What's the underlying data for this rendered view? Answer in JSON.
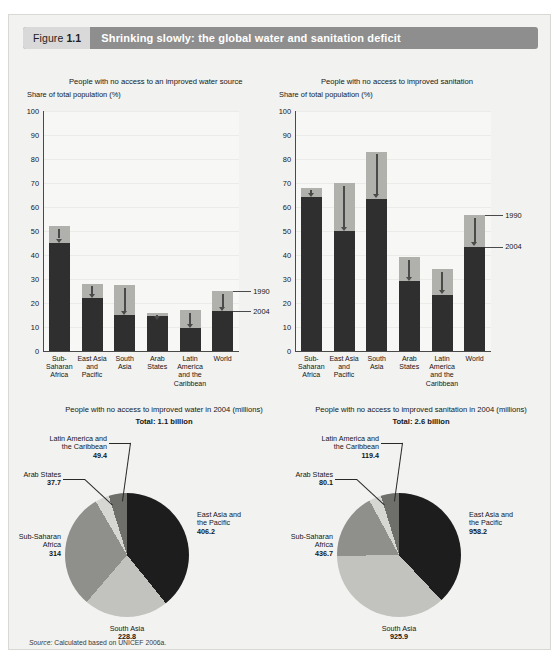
{
  "figure": {
    "number_prefix": "Figure",
    "number": "1.1",
    "title": "Shrinking slowly: the global water and sanitation deficit",
    "source_label": "Source:",
    "source_text": "Calculated based on UNICEF 2006a."
  },
  "legend": {
    "series_1990": "1990",
    "series_2004": "2004"
  },
  "chart_data": [
    {
      "type": "bar",
      "id": "water-access-bar",
      "title": "People with no access to an improved water source",
      "ylabel": "Share of total population (%)",
      "xlabel": "",
      "ylim": [
        0,
        100
      ],
      "yticks": [
        0,
        10,
        20,
        30,
        40,
        50,
        60,
        70,
        80,
        90,
        100
      ],
      "grid": true,
      "legend_position": "right",
      "categories": [
        "Sub-Saharan Africa",
        "East Asia and Pacific",
        "South Asia",
        "Arab States",
        "Latin America and the Caribbean",
        "World"
      ],
      "category_lines": [
        [
          "Sub-",
          "Saharan",
          "Africa"
        ],
        [
          "East Asia",
          "and",
          "Pacific"
        ],
        [
          "South",
          "Asia"
        ],
        [
          "Arab",
          "States"
        ],
        [
          "Latin",
          "America",
          "and the",
          "Caribbean"
        ],
        [
          "World"
        ]
      ],
      "series": [
        {
          "name": "1990",
          "color": "#b0b0ac",
          "values": [
            52.0,
            28.0,
            27.5,
            16.0,
            17.0,
            25.0
          ]
        },
        {
          "name": "2004",
          "color": "#2f2f2f",
          "values": [
            45.0,
            22.0,
            15.0,
            14.5,
            9.5,
            16.5
          ]
        }
      ]
    },
    {
      "type": "bar",
      "id": "sanitation-access-bar",
      "title": "People with no access to improved sanitation",
      "ylabel": "Share of total population (%)",
      "xlabel": "",
      "ylim": [
        0,
        100
      ],
      "yticks": [
        0,
        10,
        20,
        30,
        40,
        50,
        60,
        70,
        80,
        90,
        100
      ],
      "grid": true,
      "legend_position": "right",
      "categories": [
        "Sub-Saharan Africa",
        "East Asia and Pacific",
        "South Asia",
        "Arab States",
        "Latin America and the Caribbean",
        "World"
      ],
      "category_lines": [
        [
          "Sub-",
          "Saharan",
          "Africa"
        ],
        [
          "East Asia",
          "and",
          "Pacific"
        ],
        [
          "South",
          "Asia"
        ],
        [
          "Arab",
          "States"
        ],
        [
          "Latin",
          "America",
          "and the",
          "Caribbean"
        ],
        [
          "World"
        ]
      ],
      "series": [
        {
          "name": "1990",
          "color": "#b0b0ac",
          "values": [
            68.0,
            70.0,
            83.0,
            39.0,
            34.0,
            56.5
          ]
        },
        {
          "name": "2004",
          "color": "#2f2f2f",
          "values": [
            64.0,
            50.0,
            63.5,
            29.0,
            23.5,
            43.5
          ]
        }
      ]
    },
    {
      "type": "pie",
      "id": "water-pie",
      "title": "People with no access to improved water in 2004 (millions)",
      "total_label": "Total: 1.1 billion",
      "unit": "millions",
      "slices": [
        {
          "label": "East Asia and the Pacific",
          "label_lines": [
            "East Asia and",
            "the Pacific"
          ],
          "value": 406.2,
          "color": "#1d1d1d"
        },
        {
          "label": "South Asia",
          "label_lines": [
            "South Asia"
          ],
          "value": 228.8,
          "color": "#c2c2be"
        },
        {
          "label": "Sub-Saharan Africa",
          "label_lines": [
            "Sub-Saharan",
            "Africa"
          ],
          "value": 314.0,
          "color": "#8f8f8b"
        },
        {
          "label": "Arab States",
          "label_lines": [
            "Arab States"
          ],
          "value": 37.7,
          "color": "#d6d6d2"
        },
        {
          "label": "Latin America and the Caribbean",
          "label_lines": [
            "Latin America and",
            "the Caribbean"
          ],
          "value": 49.4,
          "color": "#6e6e6a"
        }
      ]
    },
    {
      "type": "pie",
      "id": "sanitation-pie",
      "title": "People with no access to improved sanitation in 2004 (millions)",
      "total_label": "Total: 2.6 billion",
      "unit": "millions",
      "slices": [
        {
          "label": "East Asia and the Pacific",
          "label_lines": [
            "East Asia and",
            "the Pacific"
          ],
          "value": 958.2,
          "color": "#1d1d1d"
        },
        {
          "label": "South Asia",
          "label_lines": [
            "South Asia"
          ],
          "value": 925.9,
          "color": "#c2c2be"
        },
        {
          "label": "Sub-Saharan Africa",
          "label_lines": [
            "Sub-Saharan",
            "Africa"
          ],
          "value": 436.7,
          "color": "#8f8f8b"
        },
        {
          "label": "Arab States",
          "label_lines": [
            "Arab States"
          ],
          "value": 80.1,
          "color": "#d6d6d2"
        },
        {
          "label": "Latin America and the Caribbean",
          "label_lines": [
            "Latin America and",
            "the Caribbean"
          ],
          "value": 119.4,
          "color": "#6e6e6a"
        }
      ]
    }
  ],
  "colors": {
    "header_bar": "#8e8e8e",
    "header_num_bg": "#d9d9d9",
    "panel_bg": "#f2f2f0",
    "series_1990": "#b0b0ac",
    "series_2004": "#2f2f2f"
  }
}
